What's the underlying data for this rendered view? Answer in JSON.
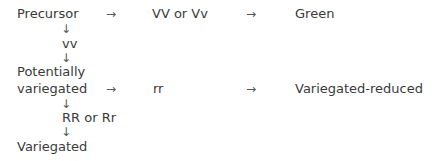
{
  "diagram": {
    "nodes": {
      "precursor": "Precursor",
      "vv_dominant": "VV or Vv",
      "green": "Green",
      "vv_recessive": "vv",
      "potentially_line1": "Potentially",
      "potentially_line2": "variegated",
      "rr_recessive": "rr",
      "variegated_reduced": "Variegated-reduced",
      "rr_dominant": "RR or Rr",
      "variegated": "Variegated"
    },
    "arrows": {
      "right": "→",
      "down": "↓"
    }
  }
}
